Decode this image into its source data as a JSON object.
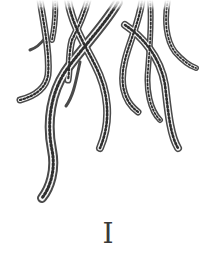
{
  "illustration": {
    "subject": "engraved octopus tentacles hanging from top",
    "tentacle_color": "#4a4a4a",
    "sucker_color": "#2e2e2e"
  },
  "chapter": {
    "numeral": "I"
  }
}
